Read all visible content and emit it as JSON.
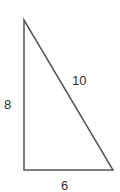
{
  "diagram": {
    "type": "right-triangle",
    "vertices": {
      "top": [
        24,
        20
      ],
      "bottom_left": [
        24,
        170
      ],
      "bottom_right": [
        113,
        170
      ]
    },
    "labels": {
      "vertical_side": "8",
      "horizontal_side": "6",
      "hypotenuse": "10"
    },
    "stroke_color": "#555555",
    "text_color": "#333333"
  }
}
